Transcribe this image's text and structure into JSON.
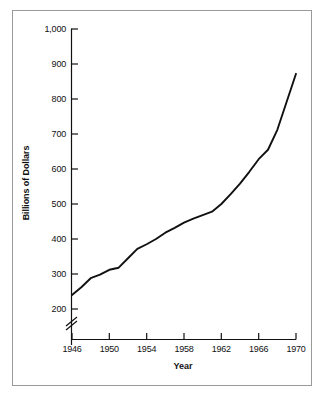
{
  "chart_data": {
    "type": "line",
    "title": "",
    "subtitle": "",
    "xlabel": "Year",
    "ylabel": "Billions of Dollars",
    "xlim": [
      1946,
      1970
    ],
    "ylim": [
      200,
      1000
    ],
    "grid": false,
    "legend": "none",
    "axis_break": {
      "axis": "y",
      "symbol": "double-slash",
      "below_value": 200,
      "note": "y-axis broken below 200"
    },
    "xticks": [
      1946,
      1950,
      1954,
      1958,
      1962,
      1966,
      1970
    ],
    "xtick_labels": [
      "1946",
      "1950",
      "1954",
      "1958",
      "1962",
      "1966",
      "1970"
    ],
    "yticks": [
      200,
      300,
      400,
      500,
      600,
      700,
      800,
      900,
      1000
    ],
    "ytick_labels": [
      "200",
      "300",
      "400",
      "500",
      "600",
      "700",
      "800",
      "900",
      "1,000"
    ],
    "series": [
      {
        "name": "Billions of Dollars",
        "color": "#111111",
        "x": [
          1946,
          1947,
          1948,
          1949,
          1950,
          1951,
          1952,
          1953,
          1954,
          1955,
          1956,
          1957,
          1958,
          1959,
          1960,
          1961,
          1962,
          1963,
          1964,
          1965,
          1966,
          1967,
          1968,
          1969,
          1970
        ],
        "values": [
          240,
          262,
          288,
          298,
          312,
          318,
          345,
          372,
          385,
          400,
          418,
          432,
          447,
          458,
          468,
          478,
          500,
          528,
          558,
          592,
          628,
          655,
          712,
          792,
          872
        ]
      }
    ]
  },
  "axis_titles": {
    "x": "Year",
    "y": "Billions of Dollars"
  },
  "ticks": {
    "y": [
      "1,000",
      "900",
      "800",
      "700",
      "600",
      "500",
      "400",
      "300",
      "200"
    ],
    "x": [
      "1946",
      "1950",
      "1954",
      "1958",
      "1962",
      "1966",
      "1970"
    ]
  }
}
